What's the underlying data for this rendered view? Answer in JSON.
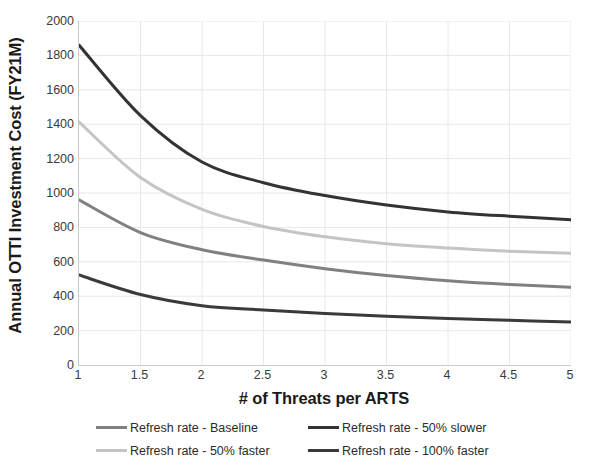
{
  "chart_data": {
    "type": "line",
    "title": "",
    "xlabel": "# of Threats per ARTS",
    "ylabel": "Annual OTTI Investment Cost (FY21M)",
    "xlim": [
      1,
      5
    ],
    "ylim": [
      0,
      2000
    ],
    "grid": true,
    "legend_position": "bottom",
    "x_ticks": [
      "1",
      "1.5",
      "2",
      "2.5",
      "3",
      "3.5",
      "4",
      "4.5",
      "5"
    ],
    "x_tick_values": [
      1,
      1.5,
      2,
      2.5,
      3,
      3.5,
      4,
      4.5,
      5
    ],
    "y_ticks": [
      "0",
      "200",
      "400",
      "600",
      "800",
      "1000",
      "1200",
      "1400",
      "1600",
      "1800",
      "2000"
    ],
    "y_tick_values": [
      0,
      200,
      400,
      600,
      800,
      1000,
      1200,
      1400,
      1600,
      1800,
      2000
    ],
    "x": [
      1,
      1.5,
      2,
      2.5,
      3,
      3.5,
      4,
      4.5,
      5
    ],
    "series": [
      {
        "name": "Refresh rate - 50% slower",
        "color": "#333333",
        "values": [
          1860,
          1450,
          1180,
          1060,
          985,
          930,
          890,
          865,
          845
        ]
      },
      {
        "name": "Refresh rate - 50% faster",
        "color": "#c4c4c4",
        "values": [
          1413,
          1090,
          905,
          805,
          745,
          705,
          680,
          662,
          650
        ]
      },
      {
        "name": "Refresh rate - Baseline",
        "color": "#808080",
        "values": [
          960,
          770,
          670,
          610,
          560,
          520,
          490,
          468,
          452
        ]
      },
      {
        "name": "Refresh rate - 100% faster",
        "color": "#3a3a3a",
        "values": [
          523,
          410,
          345,
          320,
          300,
          283,
          270,
          260,
          250
        ]
      }
    ],
    "legend": [
      {
        "label": "Refresh rate - Baseline",
        "color": "#808080"
      },
      {
        "label": "Refresh rate - 50% slower",
        "color": "#333333"
      },
      {
        "label": "Refresh rate - 50% faster",
        "color": "#c4c4c4"
      },
      {
        "label": "Refresh rate - 100% faster",
        "color": "#3a3a3a"
      }
    ],
    "colors": {
      "gridline": "#e8e8e8",
      "axis": "#c9c9c9",
      "text": "#3a3a3a",
      "title_text": "#1a1a1a",
      "background": "#ffffff"
    }
  }
}
